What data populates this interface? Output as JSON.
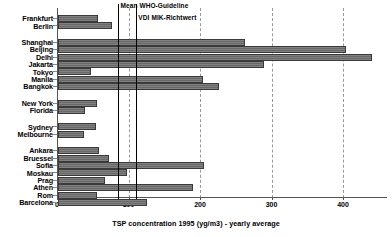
{
  "chart_data": {
    "type": "bar",
    "orientation": "horizontal",
    "title": "",
    "xlabel": "TSP concentration 1995 (yg/m3) - yearly average",
    "ylabel": "",
    "xlim": [
      0,
      460
    ],
    "xticks": [
      0,
      100,
      200,
      300,
      400
    ],
    "xtick_labels": [
      "0",
      "100",
      "200",
      "300",
      "400"
    ],
    "grid": "vertical-dashed",
    "legend": "none",
    "categories": [
      "Frankfurt",
      "Berlin",
      "Shanghai",
      "Beijing",
      "Delhi",
      "Jakarta",
      "Tokyo",
      "Manila",
      "Bangkok",
      "New York",
      "Florida",
      "Sydney",
      "Melbourne",
      "Ankara",
      "Bruessel",
      "Sofia",
      "Moskau",
      "Prag",
      "Athen",
      "Rom",
      "Barcelona"
    ],
    "values": [
      56,
      75,
      262,
      403,
      439,
      288,
      46,
      203,
      225,
      55,
      38,
      53,
      36,
      57,
      71,
      204,
      96,
      66,
      189,
      54,
      124
    ],
    "groups": [
      {
        "name": "Germany",
        "members": [
          "Frankfurt",
          "Berlin"
        ]
      },
      {
        "name": "Asia",
        "members": [
          "Shanghai",
          "Beijing",
          "Delhi",
          "Jakarta",
          "Tokyo",
          "Manila",
          "Bangkok"
        ]
      },
      {
        "name": "USA",
        "members": [
          "New York",
          "Florida"
        ]
      },
      {
        "name": "Australia",
        "members": [
          "Sydney",
          "Melbourne"
        ]
      },
      {
        "name": "Europe",
        "members": [
          "Ankara",
          "Bruessel",
          "Sofia",
          "Moskau",
          "Prag",
          "Athen",
          "Rom",
          "Barcelona"
        ]
      }
    ],
    "reference_lines": [
      {
        "label": "Mean WHO-Guideline",
        "value": 86
      },
      {
        "label": "VDI MIK-Richtwert",
        "value": 111
      }
    ],
    "annotations": [],
    "colors": {
      "bar_fill": "#6e6e6e",
      "bar_edge": "#3a3a3a",
      "reference_line": "#000000",
      "gridline": "#9a9a9a",
      "axis": "#555555",
      "background": "#ffffff"
    }
  }
}
